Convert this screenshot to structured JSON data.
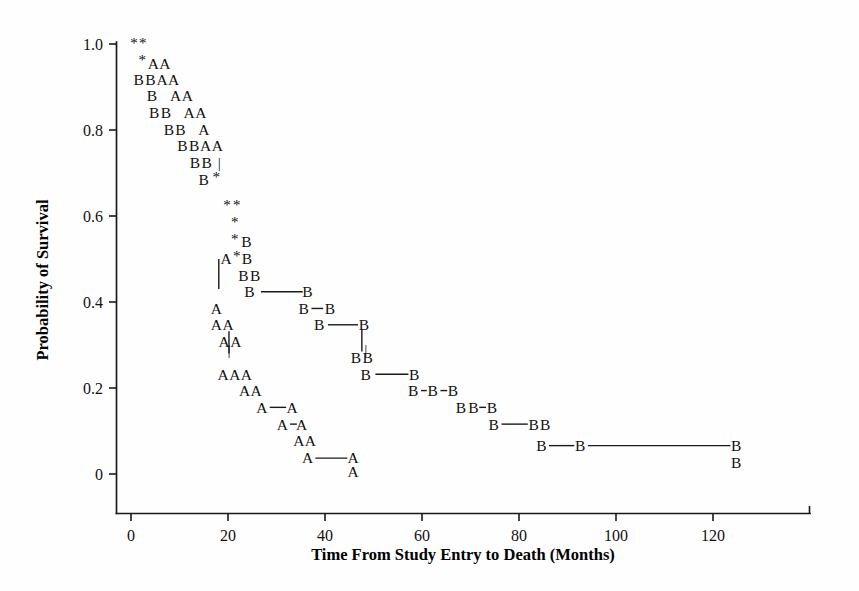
{
  "chart_data": {
    "type": "line",
    "title": "",
    "xlabel": "Time From Study Entry to Death (Months)",
    "ylabel": "Probability of Survival",
    "xlim": [
      -2.4,
      142
    ],
    "ylim": [
      0,
      1.0
    ],
    "grid": false,
    "legend_position": "none",
    "xticks": [
      "0",
      "20",
      "40",
      "60",
      "80",
      "100",
      "120"
    ],
    "xtick_values": [
      0,
      20,
      40,
      60,
      80,
      100,
      120
    ],
    "yticks": [
      "1.0",
      "0.8",
      "0.6",
      "0.4",
      "0.2",
      "0"
    ],
    "ytick_values": [
      1.0,
      0.8,
      0.6,
      0.4,
      0.2,
      0
    ],
    "marker_legend": {
      "A": "Group A survival curve marker",
      "B": "Group B survival curve marker",
      "*": "Censored observation marker"
    },
    "markers": [
      {
        "label": "*",
        "x": 0.6,
        "y": 0.995
      },
      {
        "label": "*",
        "x": 2.4,
        "y": 0.995
      },
      {
        "label": "*",
        "x": 2.3,
        "y": 0.955
      },
      {
        "label": "A",
        "x": 4.6,
        "y": 0.955
      },
      {
        "label": "A",
        "x": 7.0,
        "y": 0.955
      },
      {
        "label": "B",
        "x": 1.6,
        "y": 0.917
      },
      {
        "label": "B",
        "x": 4.0,
        "y": 0.917
      },
      {
        "label": "A",
        "x": 6.4,
        "y": 0.917
      },
      {
        "label": "A",
        "x": 8.8,
        "y": 0.917
      },
      {
        "label": "B",
        "x": 4.3,
        "y": 0.879
      },
      {
        "label": "A",
        "x": 9.2,
        "y": 0.879
      },
      {
        "label": "A",
        "x": 11.6,
        "y": 0.879
      },
      {
        "label": "B",
        "x": 4.8,
        "y": 0.841
      },
      {
        "label": "B",
        "x": 7.2,
        "y": 0.841
      },
      {
        "label": "A",
        "x": 12.0,
        "y": 0.841
      },
      {
        "label": "A",
        "x": 14.4,
        "y": 0.841
      },
      {
        "label": "B",
        "x": 7.8,
        "y": 0.801
      },
      {
        "label": "B",
        "x": 10.2,
        "y": 0.801
      },
      {
        "label": "A",
        "x": 15.0,
        "y": 0.801
      },
      {
        "label": "B",
        "x": 10.6,
        "y": 0.763
      },
      {
        "label": "B",
        "x": 13.0,
        "y": 0.763
      },
      {
        "label": "A",
        "x": 15.4,
        "y": 0.763
      },
      {
        "label": "A",
        "x": 17.8,
        "y": 0.763
      },
      {
        "label": "B",
        "x": 13.2,
        "y": 0.724
      },
      {
        "label": "B",
        "x": 15.6,
        "y": 0.724
      },
      {
        "label": "|",
        "x": 18.2,
        "y": 0.724
      },
      {
        "label": "B",
        "x": 15.0,
        "y": 0.684
      },
      {
        "label": "*",
        "x": 17.6,
        "y": 0.684
      },
      {
        "label": "*",
        "x": 19.8,
        "y": 0.618
      },
      {
        "label": "*",
        "x": 21.8,
        "y": 0.618
      },
      {
        "label": "*",
        "x": 21.4,
        "y": 0.578
      },
      {
        "label": "*",
        "x": 21.4,
        "y": 0.54
      },
      {
        "label": "B",
        "x": 23.8,
        "y": 0.54
      },
      {
        "label": "A",
        "x": 19.6,
        "y": 0.5
      },
      {
        "label": "*",
        "x": 21.8,
        "y": 0.5
      },
      {
        "label": "B",
        "x": 23.9,
        "y": 0.5
      },
      {
        "label": "B",
        "x": 23.2,
        "y": 0.462
      },
      {
        "label": "B",
        "x": 25.6,
        "y": 0.462
      },
      {
        "label": "B",
        "x": 24.4,
        "y": 0.424
      },
      {
        "label": "B",
        "x": 36.4,
        "y": 0.424
      },
      {
        "label": "A",
        "x": 17.6,
        "y": 0.385
      },
      {
        "label": "B",
        "x": 35.6,
        "y": 0.385
      },
      {
        "label": "B",
        "x": 41.0,
        "y": 0.385
      },
      {
        "label": "A",
        "x": 17.6,
        "y": 0.347
      },
      {
        "label": "A",
        "x": 20.0,
        "y": 0.347
      },
      {
        "label": "B",
        "x": 38.8,
        "y": 0.347
      },
      {
        "label": "B",
        "x": 48.0,
        "y": 0.347
      },
      {
        "label": "A",
        "x": 19.2,
        "y": 0.309
      },
      {
        "label": "A",
        "x": 21.6,
        "y": 0.309
      },
      {
        "label": "|",
        "x": 48.4,
        "y": 0.29
      },
      {
        "label": "B",
        "x": 46.4,
        "y": 0.27
      },
      {
        "label": "B",
        "x": 48.8,
        "y": 0.27
      },
      {
        "label": "|",
        "x": 20.2,
        "y": 0.29
      },
      {
        "label": "A",
        "x": 19.0,
        "y": 0.232
      },
      {
        "label": "A",
        "x": 21.4,
        "y": 0.232
      },
      {
        "label": "A",
        "x": 23.8,
        "y": 0.232
      },
      {
        "label": "B",
        "x": 48.4,
        "y": 0.232
      },
      {
        "label": "B",
        "x": 58.4,
        "y": 0.232
      },
      {
        "label": "A",
        "x": 23.4,
        "y": 0.194
      },
      {
        "label": "A",
        "x": 25.8,
        "y": 0.194
      },
      {
        "label": "B",
        "x": 58.2,
        "y": 0.194
      },
      {
        "label": "B",
        "x": 62.2,
        "y": 0.194
      },
      {
        "label": "B",
        "x": 66.4,
        "y": 0.194
      },
      {
        "label": "A",
        "x": 27.0,
        "y": 0.155
      },
      {
        "label": "A",
        "x": 33.2,
        "y": 0.155
      },
      {
        "label": "B",
        "x": 68.0,
        "y": 0.155
      },
      {
        "label": "B",
        "x": 70.6,
        "y": 0.155
      },
      {
        "label": "B",
        "x": 74.4,
        "y": 0.155
      },
      {
        "label": "A",
        "x": 31.2,
        "y": 0.116
      },
      {
        "label": "A",
        "x": 35.2,
        "y": 0.116
      },
      {
        "label": "B",
        "x": 74.8,
        "y": 0.116
      },
      {
        "label": "B",
        "x": 83.0,
        "y": 0.116
      },
      {
        "label": "B",
        "x": 85.4,
        "y": 0.116
      },
      {
        "label": "A",
        "x": 34.6,
        "y": 0.078
      },
      {
        "label": "A",
        "x": 37.0,
        "y": 0.078
      },
      {
        "label": "B",
        "x": 84.6,
        "y": 0.066
      },
      {
        "label": "B",
        "x": 92.6,
        "y": 0.066
      },
      {
        "label": "B",
        "x": 124.8,
        "y": 0.066
      },
      {
        "label": "A",
        "x": 36.4,
        "y": 0.037
      },
      {
        "label": "A",
        "x": 45.8,
        "y": 0.037
      },
      {
        "label": "B",
        "x": 124.8,
        "y": 0.026
      },
      {
        "label": "A",
        "x": 45.8,
        "y": 0.005
      }
    ],
    "connector_segments": [
      {
        "x1": 18.1,
        "y1": 0.5,
        "x2": 18.1,
        "y2": 0.43,
        "orient": "v"
      },
      {
        "x1": 26.8,
        "y1": 0.424,
        "x2": 35.4,
        "y2": 0.424,
        "orient": "h"
      },
      {
        "x1": 37.2,
        "y1": 0.385,
        "x2": 39.6,
        "y2": 0.385,
        "orient": "h"
      },
      {
        "x1": 40.6,
        "y1": 0.347,
        "x2": 46.8,
        "y2": 0.347,
        "orient": "h"
      },
      {
        "x1": 47.6,
        "y1": 0.337,
        "x2": 47.6,
        "y2": 0.285,
        "orient": "v"
      },
      {
        "x1": 20.2,
        "y1": 0.332,
        "x2": 20.2,
        "y2": 0.28,
        "orient": "v"
      },
      {
        "x1": 50.4,
        "y1": 0.232,
        "x2": 57.2,
        "y2": 0.232,
        "orient": "h"
      },
      {
        "x1": 59.8,
        "y1": 0.194,
        "x2": 61.0,
        "y2": 0.194,
        "orient": "h"
      },
      {
        "x1": 63.8,
        "y1": 0.194,
        "x2": 65.2,
        "y2": 0.194,
        "orient": "h"
      },
      {
        "x1": 71.8,
        "y1": 0.155,
        "x2": 73.2,
        "y2": 0.155,
        "orient": "h"
      },
      {
        "x1": 28.6,
        "y1": 0.155,
        "x2": 32.0,
        "y2": 0.155,
        "orient": "h"
      },
      {
        "x1": 32.8,
        "y1": 0.116,
        "x2": 34.2,
        "y2": 0.116,
        "orient": "h"
      },
      {
        "x1": 76.4,
        "y1": 0.116,
        "x2": 81.8,
        "y2": 0.116,
        "orient": "h"
      },
      {
        "x1": 86.2,
        "y1": 0.066,
        "x2": 91.4,
        "y2": 0.066,
        "orient": "h"
      },
      {
        "x1": 94.2,
        "y1": 0.066,
        "x2": 123.6,
        "y2": 0.066,
        "orient": "h"
      },
      {
        "x1": 38.0,
        "y1": 0.037,
        "x2": 44.6,
        "y2": 0.037,
        "orient": "h"
      }
    ]
  },
  "axes": {
    "x_title": "Time From Study Entry to Death (Months)",
    "y_title": "Probability of Survival"
  }
}
